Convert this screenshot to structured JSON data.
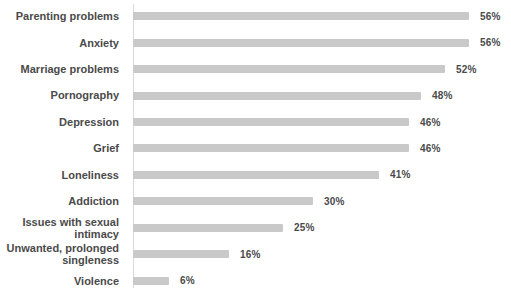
{
  "chart_data": {
    "type": "bar",
    "orientation": "horizontal",
    "title": "",
    "xlabel": "",
    "ylabel": "",
    "categories": [
      "Parenting problems",
      "Anxiety",
      "Marriage problems",
      "Pornography",
      "Depression",
      "Grief",
      "Loneliness",
      "Addiction",
      "Issues with sexual intimacy",
      "Unwanted, prolonged singleness",
      "Violence"
    ],
    "values": [
      56,
      56,
      52,
      48,
      46,
      46,
      41,
      30,
      25,
      16,
      6
    ],
    "value_labels": [
      "56%",
      "56%",
      "52%",
      "48%",
      "46%",
      "46%",
      "41%",
      "30%",
      "25%",
      "16%",
      "6%"
    ],
    "unit": "%",
    "xlim": [
      0,
      60
    ],
    "grid": false,
    "legend": "none",
    "colors": {
      "bar": "#c9c9c9",
      "axis_line": "#d9d9d9",
      "text": "#4a4a4a",
      "background": "#ffffff"
    }
  }
}
